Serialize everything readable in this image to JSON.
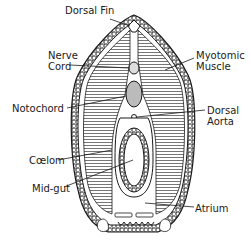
{
  "diagram": {
    "labels": {
      "dorsal_fin": "Dorsal Fin",
      "nerve_cord_1": "Nerve",
      "nerve_cord_2": "Cord",
      "myotomic_1": "Myotomic",
      "myotomic_2": "Muscle",
      "notochord": "Notochord",
      "dorsal_aorta_1": "Dorsal",
      "dorsal_aorta_2": "Aorta",
      "coelom": "Cœlom",
      "mid_gut": "Mid-gut",
      "atrium": "Atrium"
    },
    "colors": {
      "ink": "#1a1a1a",
      "background": "#ffffff",
      "fill": "#f4f4f4"
    }
  }
}
